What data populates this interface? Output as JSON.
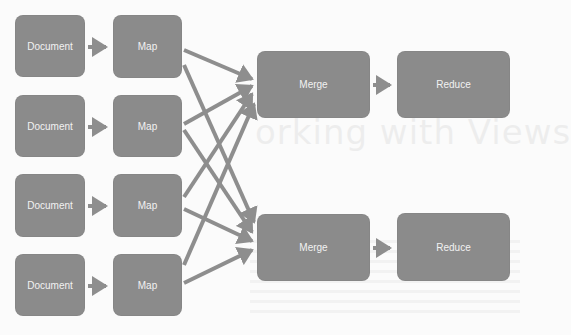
{
  "background_text": "orking with Views",
  "colors": {
    "node_fill": "#8b8b8b",
    "node_text": "#f2f2f2",
    "arrow": "#8e8e8e",
    "background": "#fbfbfb"
  },
  "nodes": {
    "documents": [
      {
        "label": "Document",
        "x": 15,
        "y": 15,
        "w": 70,
        "h": 62
      },
      {
        "label": "Document",
        "x": 15,
        "y": 95,
        "w": 70,
        "h": 62
      },
      {
        "label": "Document",
        "x": 15,
        "y": 174,
        "w": 70,
        "h": 63
      },
      {
        "label": "Document",
        "x": 15,
        "y": 254,
        "w": 70,
        "h": 62
      }
    ],
    "maps": [
      {
        "label": "Map",
        "x": 113,
        "y": 15,
        "w": 69,
        "h": 63
      },
      {
        "label": "Map",
        "x": 113,
        "y": 95,
        "w": 69,
        "h": 62
      },
      {
        "label": "Map",
        "x": 113,
        "y": 174,
        "w": 69,
        "h": 63
      },
      {
        "label": "Map",
        "x": 113,
        "y": 254,
        "w": 69,
        "h": 62
      }
    ],
    "merges": [
      {
        "label": "Merge",
        "x": 257,
        "y": 51,
        "w": 113,
        "h": 67
      },
      {
        "label": "Merge",
        "x": 257,
        "y": 214,
        "w": 113,
        "h": 67
      }
    ],
    "reduces": [
      {
        "label": "Reduce",
        "x": 397,
        "y": 51,
        "w": 113,
        "h": 67
      },
      {
        "label": "Reduce",
        "x": 397,
        "y": 213,
        "w": 113,
        "h": 68
      }
    ]
  },
  "edges": [
    {
      "from": "Document 1",
      "to": "Map 1"
    },
    {
      "from": "Document 2",
      "to": "Map 2"
    },
    {
      "from": "Document 3",
      "to": "Map 3"
    },
    {
      "from": "Document 4",
      "to": "Map 4"
    },
    {
      "from": "Map 1",
      "to": "Merge 1"
    },
    {
      "from": "Map 1",
      "to": "Merge 2"
    },
    {
      "from": "Map 2",
      "to": "Merge 1"
    },
    {
      "from": "Map 2",
      "to": "Merge 2"
    },
    {
      "from": "Map 3",
      "to": "Merge 1"
    },
    {
      "from": "Map 3",
      "to": "Merge 2"
    },
    {
      "from": "Map 4",
      "to": "Merge 1"
    },
    {
      "from": "Map 4",
      "to": "Merge 2"
    },
    {
      "from": "Merge 1",
      "to": "Reduce 1"
    },
    {
      "from": "Merge 2",
      "to": "Reduce 2"
    }
  ]
}
